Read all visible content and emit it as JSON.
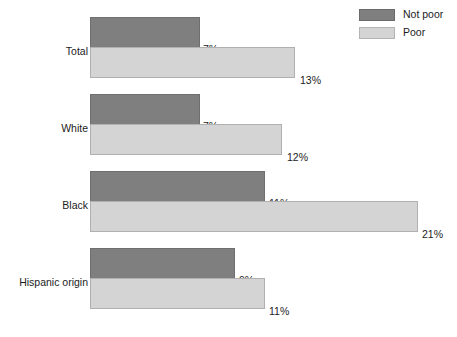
{
  "legend": {
    "position": "top-right",
    "entries": [
      {
        "label": "Not poor",
        "swatch": "legend-swatch-not-poor",
        "color": "#7f7f7f"
      },
      {
        "label": "Poor",
        "swatch": "legend-swatch-poor",
        "color": "#d4d4d4"
      }
    ]
  },
  "chart_data": {
    "type": "bar",
    "orientation": "horizontal",
    "title": "",
    "subtitle": "",
    "xlabel": "",
    "ylabel": "",
    "grid": false,
    "legend_position": "top-right",
    "xlim": [
      0,
      23
    ],
    "value_suffix": "%",
    "categories": [
      "Total",
      "White",
      "Black",
      "Hispanic origin"
    ],
    "series": [
      {
        "name": "Not poor",
        "color": "#7f7f7f",
        "values": [
          7,
          7,
          11,
          9
        ],
        "labels": [
          "7%",
          "7%",
          "11%",
          "9%"
        ]
      },
      {
        "name": "Poor",
        "color": "#d4d4d4",
        "values": [
          13,
          12,
          21,
          11
        ],
        "labels": [
          "13%",
          "12%",
          "21%",
          "11%"
        ]
      }
    ]
  },
  "groups": [
    {
      "category": "Total",
      "top": 17,
      "label_top": 45,
      "bars": [
        {
          "series": "Not poor",
          "value": 7,
          "label": "7%",
          "kind": "notpoor",
          "width": 110,
          "top": 0,
          "label_left": 203,
          "label_top": 26
        },
        {
          "series": "Poor",
          "value": 13,
          "label": "13%",
          "kind": "poor",
          "width": 205,
          "top": 30,
          "label_left": 300,
          "label_top": 57
        }
      ]
    },
    {
      "category": "White",
      "top": 94,
      "label_top": 122,
      "bars": [
        {
          "series": "Not poor",
          "value": 7,
          "label": "7%",
          "kind": "notpoor",
          "width": 110,
          "top": 0,
          "label_left": 203,
          "label_top": 26
        },
        {
          "series": "Poor",
          "value": 12,
          "label": "12%",
          "kind": "poor",
          "width": 192,
          "top": 30,
          "label_left": 287,
          "label_top": 57
        }
      ]
    },
    {
      "category": "Black",
      "top": 171,
      "label_top": 199,
      "bars": [
        {
          "series": "Not poor",
          "value": 11,
          "label": "11%",
          "kind": "notpoor",
          "width": 175,
          "top": 0,
          "label_left": 269,
          "label_top": 26
        },
        {
          "series": "Poor",
          "value": 21,
          "label": "21%",
          "kind": "poor",
          "width": 328,
          "top": 30,
          "label_left": 422,
          "label_top": 57
        }
      ]
    },
    {
      "category": "Hispanic origin",
      "top": 248,
      "label_top": 276,
      "bars": [
        {
          "series": "Not poor",
          "value": 9,
          "label": "9%",
          "kind": "notpoor",
          "width": 145,
          "top": 0,
          "label_left": 239,
          "label_top": 26
        },
        {
          "series": "Poor",
          "value": 11,
          "label": "11%",
          "kind": "poor",
          "width": 175,
          "top": 30,
          "label_left": 269,
          "label_top": 57
        }
      ]
    }
  ]
}
